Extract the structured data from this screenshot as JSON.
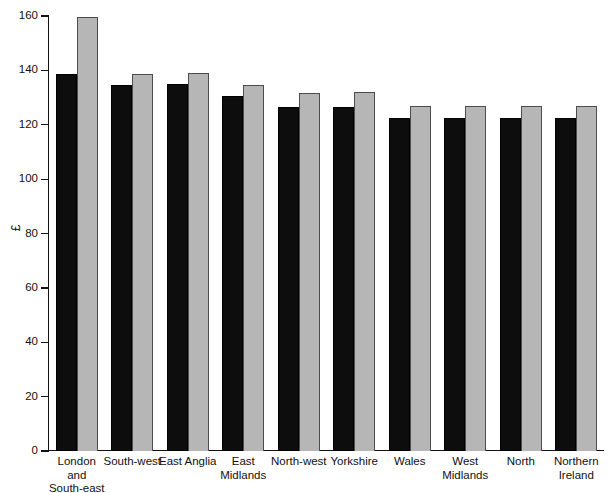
{
  "chart_data": {
    "type": "bar",
    "title": "",
    "xlabel": "",
    "ylabel": "£",
    "ylim": [
      0,
      160
    ],
    "ytick_step": 20,
    "yticks": [
      0,
      20,
      40,
      60,
      80,
      100,
      120,
      140,
      160
    ],
    "ytick_labels": [
      "0",
      "20",
      "40",
      "60",
      "80",
      "100",
      "120",
      "140",
      "160"
    ],
    "grid": false,
    "legend": "none",
    "categories": [
      "London\nand\nSouth-east",
      "South-west",
      "East Anglia",
      "East\nMidlands",
      "North-west",
      "Yorkshire",
      "Wales",
      "West\nMidlands",
      "North",
      "Northern\nIreland"
    ],
    "series": [
      {
        "name": "series-1",
        "color": "#0d0d0d",
        "values": [
          138.5,
          134.5,
          135.0,
          130.5,
          126.5,
          126.5,
          122.5,
          122.5,
          122.5,
          122.5
        ]
      },
      {
        "name": "series-2",
        "color": "#b6b6b6",
        "values": [
          159.5,
          138.5,
          139.0,
          134.5,
          131.5,
          132.0,
          127.0,
          127.0,
          127.0,
          127.0
        ]
      }
    ]
  },
  "colors": {
    "series_1": "#0d0d0d",
    "series_2": "#b6b6b6",
    "axis": "#111111",
    "background": "#ffffff"
  }
}
